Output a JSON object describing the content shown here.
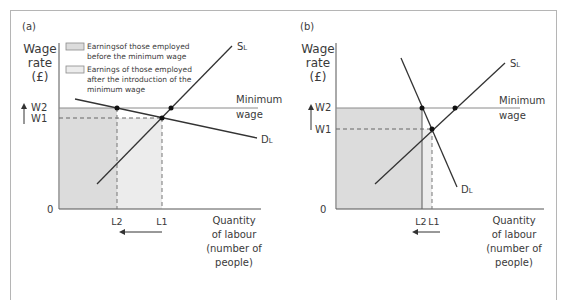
{
  "figure": {
    "colors": {
      "line": "#333333",
      "axis": "#555555",
      "min_wage_line": "#8a8a8a",
      "shade_before": "#dcdcdc",
      "shade_after": "#ececec",
      "frame": "#b5b5b5"
    },
    "panel_a": {
      "tag": "(a)",
      "ylabel": [
        "Wage",
        "rate",
        "(£)"
      ],
      "xlabel": [
        "Quantity",
        "of labour",
        "(number of",
        "people)"
      ],
      "origin": "0",
      "w2": "W2",
      "w1": "W1",
      "l2": "L2",
      "l1": "L1",
      "supply_label": "S",
      "supply_sub": "L",
      "demand_label": "D",
      "demand_sub": "L",
      "min_wage": [
        "Minimum",
        "wage"
      ],
      "legend": [
        {
          "lines": [
            "Earningsof those employed",
            "before the minimum wage"
          ]
        },
        {
          "lines": [
            "Earnings of those employed",
            "after the introduction of the",
            "minimum wage"
          ]
        }
      ]
    },
    "panel_b": {
      "tag": "(b)",
      "ylabel": [
        "Wage",
        "rate",
        "(£)"
      ],
      "xlabel": [
        "Quantity",
        "of labour",
        "(number of",
        "people)"
      ],
      "origin": "0",
      "w2": "W2",
      "w1": "W1",
      "l2": "L2",
      "l1": "L1",
      "supply_label": "S",
      "supply_sub": "L",
      "demand_label": "D",
      "demand_sub": "L",
      "min_wage": [
        "Minimum",
        "wage"
      ]
    }
  }
}
